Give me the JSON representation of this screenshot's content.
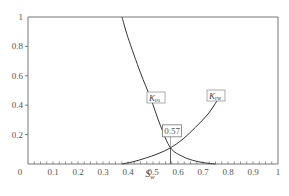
{
  "chart_data": {
    "type": "line",
    "title": "",
    "xlabel": "S_w",
    "ylabel": "",
    "xlim": [
      0,
      1
    ],
    "ylim": [
      0,
      1
    ],
    "grid": false,
    "x_ticks": [
      "0",
      "0.1",
      "0.2",
      "0.3",
      "0.4",
      "0.5",
      "0.6",
      "0.7",
      "0.8",
      "0.9",
      "1"
    ],
    "y_ticks": [
      "0.2",
      "0.4",
      "0.6",
      "0.8",
      "1"
    ],
    "series": [
      {
        "name": "K_ro",
        "label": "K",
        "label_sub": "ro",
        "x": [
          0.376,
          0.4,
          0.45,
          0.49,
          0.53,
          0.57,
          0.62,
          0.67,
          0.72,
          0.75
        ],
        "y": [
          1.0,
          0.86,
          0.62,
          0.45,
          0.26,
          0.11,
          0.05,
          0.02,
          0.005,
          0.0
        ]
      },
      {
        "name": "K_rw",
        "label": "K",
        "label_sub": "rw",
        "x": [
          0.376,
          0.42,
          0.47,
          0.52,
          0.57,
          0.62,
          0.67,
          0.72,
          0.76
        ],
        "y": [
          0.0,
          0.015,
          0.04,
          0.07,
          0.11,
          0.17,
          0.25,
          0.34,
          0.44
        ]
      }
    ],
    "annotations": [
      {
        "text": "0.57",
        "x": 0.57,
        "y": 0.11,
        "note": "intersection with vertical drop line"
      }
    ]
  }
}
